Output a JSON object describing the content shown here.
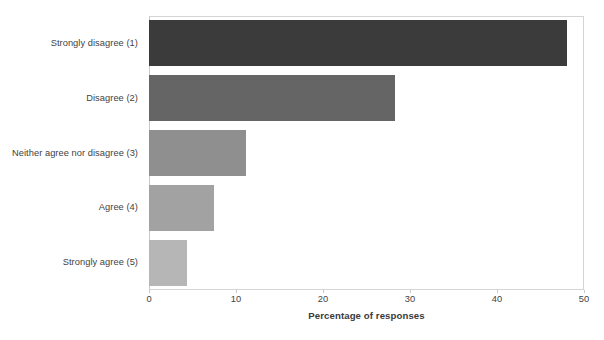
{
  "chart_data": {
    "type": "bar",
    "orientation": "horizontal",
    "title": "",
    "xlabel": "Percentage of responses",
    "ylabel": "",
    "categories": [
      "Strongly disagree (1)",
      "Disagree (2)",
      "Neither agree nor disagree (3)",
      "Agree (4)",
      "Strongly agree (5)"
    ],
    "values": [
      48.0,
      28.3,
      11.1,
      7.5,
      4.4
    ],
    "bar_colors": [
      "#3b3b3b",
      "#656565",
      "#8f8f8f",
      "#a2a2a2",
      "#b6b6b6"
    ],
    "xlim": [
      0,
      50
    ],
    "xticks": [
      0,
      10,
      20,
      30,
      40,
      50
    ],
    "xtick_labels": [
      "0",
      "10",
      "20",
      "30",
      "40",
      "50"
    ],
    "grid": false,
    "legend": "none",
    "frame_color": "#d4d4d4"
  }
}
